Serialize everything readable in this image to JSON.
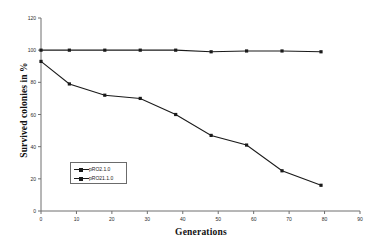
{
  "chart_data": {
    "type": "line",
    "title": "",
    "xlabel": "Generations",
    "ylabel": "Survived colonies in %",
    "xlim": [
      0,
      90
    ],
    "ylim": [
      0,
      120
    ],
    "xticks": [
      0,
      10,
      20,
      30,
      40,
      50,
      60,
      70,
      80,
      90
    ],
    "yticks": [
      0,
      20,
      40,
      60,
      80,
      100,
      120
    ],
    "xtick_labels": [
      "0",
      "10",
      "20",
      "30",
      "40",
      "50",
      "60",
      "70",
      "80",
      "90"
    ],
    "ytick_labels": [
      "0",
      "20",
      "40",
      "60",
      "80",
      "100",
      "120"
    ],
    "grid": false,
    "legend_position": "lower-left-inside",
    "marker": "square",
    "line_color": "#1a1a1a",
    "x": [
      0,
      8,
      18,
      28,
      38,
      48,
      58,
      68,
      79
    ],
    "series": [
      {
        "name": "pRO2.1.0",
        "values": [
          100,
          100,
          100,
          100,
          100,
          99,
          99.5,
          99.5,
          99
        ]
      },
      {
        "name": "pRO21.1.0",
        "values": [
          93,
          79,
          72,
          70,
          60,
          47,
          41,
          25,
          16
        ]
      }
    ]
  },
  "legend": {
    "entries": [
      {
        "label": "pRO2.1.0"
      },
      {
        "label": "pRO21.1.0"
      }
    ]
  },
  "axes": {
    "y_title": "Survived colonies in %",
    "x_title": "Generations"
  }
}
